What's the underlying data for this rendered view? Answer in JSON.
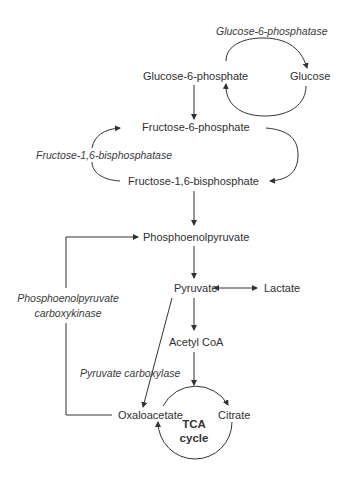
{
  "diagram": {
    "nodes": {
      "glucose_6_phosphate": "Glucose-6-phosphate",
      "glucose": "Glucose",
      "fructose_6_phosphate": "Fructose-6-phosphate",
      "fructose_1_6_bisphosphate": "Fructose-1,6-bisphosphate",
      "phosphoenolpyruvate": "Phosphoenolpyruvate",
      "pyruvate": "Pyruvate",
      "lactate": "Lactate",
      "acetyl_coa": "Acetyl CoA",
      "oxaloacetate": "Oxaloacetate",
      "citrate": "Citrate",
      "tca_line1": "TCA",
      "tca_line2": "cycle"
    },
    "enzymes": {
      "glucose_6_phosphatase": "Glucose-6-phosphatase",
      "fructose_1_6_bisphosphatase": "Fructose-1,6-bisphosphatase",
      "pepck_line1": "Phosphoenolpyruvate",
      "pepck_line2": "carboxykinase",
      "pyruvate_carboxylase": "Pyruvate carboxylase"
    },
    "colors": {
      "text": "#2f2f2f",
      "lines": "#333333",
      "background": "#ffffff"
    }
  }
}
